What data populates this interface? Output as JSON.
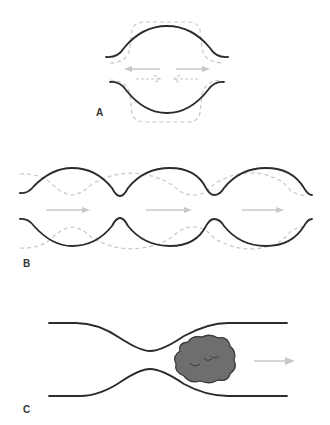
{
  "panels": [
    {
      "id": "A",
      "label": "A",
      "description": "Single vessel segment: walls bulge outward (solid) vs. dashed alternative contour; arrows indicate outward and inward flow"
    },
    {
      "id": "B",
      "label": "B",
      "description": "Peristaltic wave: solid walls with three bulges, dashed phase-shifted wall, three rightward arrows"
    },
    {
      "id": "C",
      "label": "C",
      "description": "Constricted tube with a bolus (gray lump) moving right past the constriction"
    }
  ],
  "colors": {
    "wall": "#2b2b2b",
    "ghost": "#c8c8c8",
    "bolus_fill": "#6e6e6e",
    "bolus_stroke": "#3a3a3a",
    "arrow": "#c8c8c8",
    "label": "#333333"
  }
}
